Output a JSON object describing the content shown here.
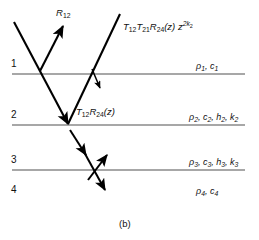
{
  "figure": {
    "caption": "(b)",
    "type": "ray-path-diagram-layered-medium"
  },
  "interfaces": [
    {
      "number": "1",
      "y": 74,
      "x_start": 12,
      "x_end": 245
    },
    {
      "number": "2",
      "y": 125,
      "x_start": 12,
      "x_end": 245
    },
    {
      "number": "3",
      "y": 170,
      "x_start": 12,
      "x_end": 245
    }
  ],
  "layer_numbers": [
    {
      "label": "1",
      "x": 12,
      "y": 64
    },
    {
      "label": "2",
      "x": 12,
      "y": 115
    },
    {
      "label": "3",
      "x": 12,
      "y": 160
    },
    {
      "label": "4",
      "x": 12,
      "y": 190
    }
  ],
  "layer_properties": [
    {
      "rho": "ρ",
      "rho_sub": "1",
      "c": "c",
      "c_sub": "1",
      "h": null,
      "h_sub": null,
      "k": null,
      "k_sub": null,
      "x": 196,
      "y": 66
    },
    {
      "rho": "ρ",
      "rho_sub": "2",
      "c": "c",
      "c_sub": "2",
      "h": "h",
      "h_sub": "2",
      "k": "k",
      "k_sub": "2",
      "x": 189,
      "y": 117
    },
    {
      "rho": "ρ",
      "rho_sub": "3",
      "c": "c",
      "c_sub": "3",
      "h": "h",
      "h_sub": "3",
      "k": "k",
      "k_sub": "3",
      "x": 189,
      "y": 162
    },
    {
      "rho": "ρ",
      "rho_sub": "4",
      "c": "c",
      "c_sub": "4",
      "h": null,
      "h_sub": null,
      "k": null,
      "k_sub": null,
      "x": 196,
      "y": 191
    }
  ],
  "ray_labels": {
    "reflection_top": {
      "base": "R",
      "sub": "12",
      "x": 56,
      "y": 11
    },
    "transmission_up": {
      "t1": "T",
      "t1_sub": "12",
      "t2": "T",
      "t2_sub": "21",
      "r": "R",
      "r_sub": "24",
      "arg": "(z)",
      "z": "z",
      "z_sup": "2k",
      "z_sup_sub": "2",
      "x": 123,
      "y": 24
    },
    "transmission_down": {
      "t": "T",
      "t_sub": "12",
      "r": "R",
      "r_sub": "24",
      "arg": "(z)",
      "x": 76,
      "y": 111
    }
  },
  "colors": {
    "interface_line": "#8a8a8a",
    "ray_line": "#000000",
    "text": "#111111",
    "background": "#ffffff"
  }
}
